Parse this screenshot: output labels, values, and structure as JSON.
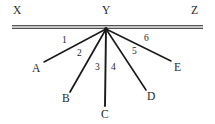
{
  "figure": {
    "kind": "geometry-diagram",
    "background_color": "#ffffff",
    "stroke_color": "#1a1a1a",
    "label_color": "#272727",
    "canvas": {
      "width": 215,
      "height": 124
    },
    "baseline": {
      "name": "line-XYZ",
      "style": "double-line",
      "x1": 12,
      "x2": 203,
      "y": 27,
      "gap": 2.6,
      "stroke_width": 1.1
    },
    "vertex": {
      "label": "Y",
      "x": 106,
      "y": 29
    },
    "point_labels": [
      {
        "id": "X",
        "text": "X",
        "x": 13,
        "y": 5
      },
      {
        "id": "Y",
        "text": "Y",
        "x": 102,
        "y": 5
      },
      {
        "id": "Z",
        "text": "Z",
        "x": 191,
        "y": 5
      },
      {
        "id": "A",
        "text": "A",
        "x": 32,
        "y": 63
      },
      {
        "id": "B",
        "text": "B",
        "x": 62,
        "y": 93
      },
      {
        "id": "C",
        "text": "C",
        "x": 101,
        "y": 109
      },
      {
        "id": "D",
        "text": "D",
        "x": 147,
        "y": 91
      },
      {
        "id": "E",
        "text": "E",
        "x": 174,
        "y": 62
      }
    ],
    "rays": [
      {
        "id": "YA",
        "from": "Y",
        "to": "A",
        "x1": 106,
        "y1": 29,
        "x2": 44,
        "y2": 62,
        "stroke_width": 1.5
      },
      {
        "id": "YB",
        "from": "Y",
        "to": "B",
        "x1": 106,
        "y1": 29,
        "x2": 70,
        "y2": 92,
        "stroke_width": 1.7
      },
      {
        "id": "YC",
        "from": "Y",
        "to": "C",
        "x1": 106,
        "y1": 29,
        "x2": 105,
        "y2": 106,
        "stroke_width": 1.9
      },
      {
        "id": "YD",
        "from": "Y",
        "to": "D",
        "x1": 106,
        "y1": 29,
        "x2": 146,
        "y2": 90,
        "stroke_width": 1.6
      },
      {
        "id": "YE",
        "from": "Y",
        "to": "E",
        "x1": 106,
        "y1": 29,
        "x2": 171,
        "y2": 61,
        "stroke_width": 1.5
      }
    ],
    "angle_labels": [
      {
        "id": "angle-1",
        "text": "1",
        "x": 62,
        "y": 36,
        "between": [
          "YX",
          "YA"
        ]
      },
      {
        "id": "angle-2",
        "text": "2",
        "x": 77,
        "y": 49,
        "between": [
          "YA",
          "YB"
        ]
      },
      {
        "id": "angle-3",
        "text": "3",
        "x": 95,
        "y": 63,
        "between": [
          "YB",
          "YC"
        ]
      },
      {
        "id": "angle-4",
        "text": "4",
        "x": 111,
        "y": 63,
        "between": [
          "YC",
          "YD"
        ]
      },
      {
        "id": "angle-5",
        "text": "5",
        "x": 132,
        "y": 47,
        "between": [
          "YD",
          "YE"
        ]
      },
      {
        "id": "angle-6",
        "text": "6",
        "x": 144,
        "y": 34,
        "between": [
          "YE",
          "YZ"
        ]
      }
    ]
  }
}
